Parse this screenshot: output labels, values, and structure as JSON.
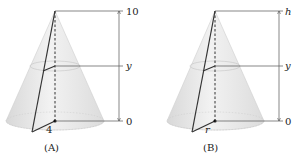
{
  "figures": [
    {
      "caption": "(A)",
      "top_label": "10",
      "mid_label": "y",
      "bottom_label": "0",
      "radius_label": "4"
    },
    {
      "caption": "(B)",
      "top_label": "h",
      "mid_label": "y",
      "bottom_label": "0",
      "radius_label": "r"
    }
  ],
  "colors": {
    "cone_fill": "#e6e6e6",
    "line": "#333333",
    "dim_line": "#555555"
  }
}
